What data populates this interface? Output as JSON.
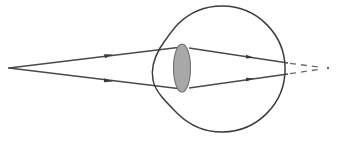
{
  "diagram": {
    "title": "",
    "colors": {
      "background": "#ffffff",
      "line": "#4a4a4a",
      "lens_fill": "#a8a8a8",
      "dashed": "#6a6a6a"
    },
    "elements": [
      {
        "id": "point-source",
        "type": "point",
        "x": 9,
        "y": 68
      },
      {
        "id": "incoming-ray-upper",
        "type": "line",
        "from": [
          9,
          68
        ],
        "to": [
          182,
          47
        ],
        "arrow_at": [
          110,
          55
        ]
      },
      {
        "id": "incoming-ray-lower",
        "type": "line",
        "from": [
          9,
          68
        ],
        "to": [
          182,
          89
        ],
        "arrow_at": [
          110,
          81
        ]
      },
      {
        "id": "eyeball",
        "type": "circle-with-cornea",
        "cx": 222,
        "cy": 69,
        "r": 63
      },
      {
        "id": "lens",
        "type": "ellipse",
        "cx": 182,
        "cy": 68,
        "rx": 9,
        "ry": 24
      },
      {
        "id": "refracted-ray-upper",
        "type": "line",
        "from": [
          182,
          47
        ],
        "to": [
          288,
          63
        ],
        "arrow_at": [
          250,
          57
        ]
      },
      {
        "id": "refracted-ray-lower",
        "type": "line",
        "from": [
          182,
          89
        ],
        "to": [
          288,
          74
        ],
        "arrow_at": [
          250,
          79
        ]
      },
      {
        "id": "virtual-extension-upper",
        "type": "dashed-line",
        "from": [
          288,
          63
        ],
        "to": [
          326,
          68
        ]
      },
      {
        "id": "virtual-extension-lower",
        "type": "dashed-line",
        "from": [
          288,
          74
        ],
        "to": [
          326,
          68
        ]
      },
      {
        "id": "focal-point",
        "type": "point",
        "x": 328,
        "y": 68
      }
    ],
    "labels": []
  }
}
